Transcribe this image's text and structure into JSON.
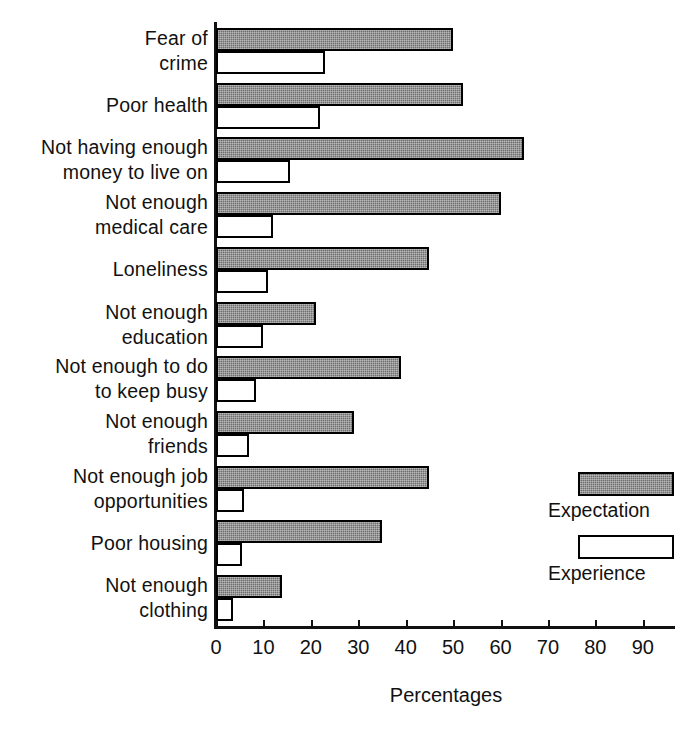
{
  "chart_data": {
    "type": "bar",
    "orientation": "horizontal",
    "title": "",
    "xlabel": "Percentages",
    "ylabel": "",
    "xlim": [
      0,
      97
    ],
    "xticks": [
      0,
      10,
      20,
      30,
      40,
      50,
      60,
      70,
      80,
      90
    ],
    "grid": false,
    "legend_position": "right",
    "categories": [
      "Fear of\ncrime",
      "Poor health",
      "Not having enough\nmoney to live on",
      "Not enough\nmedical care",
      "Loneliness",
      "Not enough\neducation",
      "Not enough to do\nto keep busy",
      "Not enough\nfriends",
      "Not enough job\nopportunities",
      "Poor housing",
      "Not enough\nclothing"
    ],
    "series": [
      {
        "name": "Expectation",
        "color": "#6e6e6e",
        "values": [
          50,
          52,
          65,
          60,
          45,
          21,
          39,
          29,
          45,
          35,
          14
        ]
      },
      {
        "name": "Experience",
        "color": "#ffffff",
        "values": [
          23,
          22,
          15.5,
          12,
          11,
          10,
          8.5,
          7,
          6,
          5.5,
          3.5
        ]
      }
    ]
  },
  "legend": {
    "items": [
      {
        "label": "Expectation",
        "swatch": "filled-gray-swatch"
      },
      {
        "label": "Experience",
        "swatch": "empty-white-swatch"
      }
    ]
  },
  "axis": {
    "x_title": "Percentages",
    "tick_labels": [
      "0",
      "10",
      "20",
      "30",
      "40",
      "50",
      "60",
      "70",
      "80",
      "90"
    ]
  }
}
